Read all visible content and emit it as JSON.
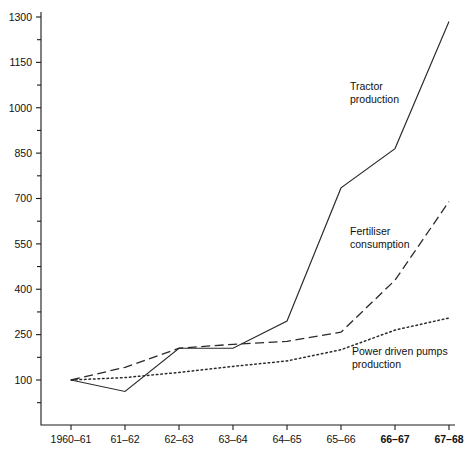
{
  "chart_data": {
    "type": "line",
    "title": "",
    "xlabel": "",
    "ylabel": "",
    "grid": false,
    "legend_position": "inline-annotations",
    "categories": [
      "1960–61",
      "61–62",
      "62–63",
      "63–64",
      "64–65",
      "65–66",
      "66–67",
      "67–68"
    ],
    "categories_bold": [
      false,
      false,
      false,
      false,
      false,
      false,
      true,
      true
    ],
    "ylim": [
      25,
      1300
    ],
    "yticks": [
      100,
      250,
      400,
      550,
      700,
      850,
      1000,
      1150,
      1300
    ],
    "yticks_minor": [
      25,
      175,
      325,
      475,
      625,
      775,
      925,
      1075,
      1225
    ],
    "series": [
      {
        "name": "Tractor production",
        "style": "solid",
        "values": [
          100,
          62,
          205,
          205,
          295,
          735,
          865,
          1285
        ],
        "annotation": {
          "lines": [
            "Tractor",
            "production"
          ],
          "x": 350,
          "y": 90
        }
      },
      {
        "name": "Fertiliser consumption",
        "style": "dashed",
        "values": [
          100,
          142,
          205,
          218,
          228,
          258,
          430,
          690
        ],
        "annotation": {
          "lines": [
            "Fertiliser",
            "consumption"
          ],
          "x": 350,
          "y": 235
        }
      },
      {
        "name": "Power driven pumps production",
        "style": "dotted",
        "values": [
          100,
          108,
          125,
          145,
          163,
          200,
          265,
          305
        ],
        "annotation": {
          "lines": [
            "Power driven pumps",
            "production"
          ],
          "x": 352,
          "y": 355
        }
      }
    ]
  },
  "geometry": {
    "plot_left": 41,
    "plot_right": 455,
    "plot_top": 12,
    "plot_bottom": 425,
    "x_first": 71,
    "x_step": 54,
    "y_value_top": 1300,
    "y_pixel_top": 17,
    "y_value_ref": 100,
    "y_pixel_ref": 380
  }
}
